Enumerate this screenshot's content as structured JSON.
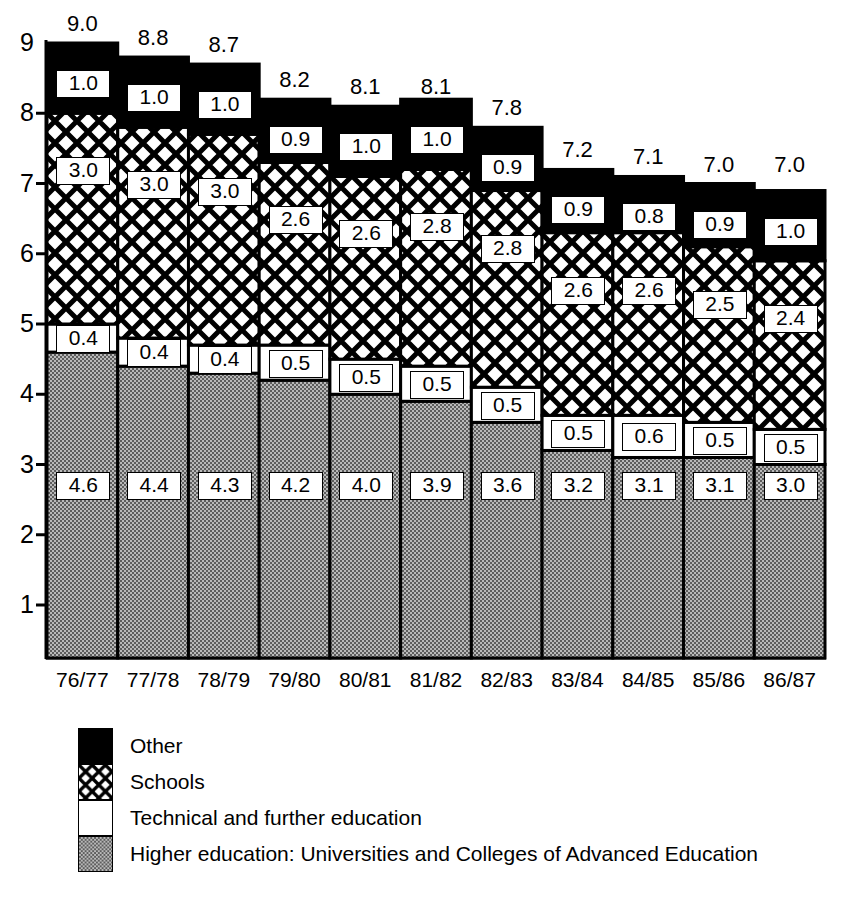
{
  "chart_data": {
    "type": "bar",
    "stacked": true,
    "title": "",
    "subtitle": "",
    "xlabel": "",
    "ylabel": "",
    "categories": [
      "76/77",
      "77/78",
      "78/79",
      "79/80",
      "80/81",
      "81/82",
      "82/83",
      "83/84",
      "84/85",
      "85/86",
      "86/87"
    ],
    "yticks": [
      1,
      2,
      3,
      4,
      5,
      6,
      7,
      8,
      9
    ],
    "ylim": [
      0,
      9.4
    ],
    "grid": false,
    "legend_position": "bottom-left",
    "series": [
      {
        "name": "Higher education: Universities and Colleges of Advanced Education",
        "fill": "grey-stipple",
        "color": "#9a9a9a",
        "values": [
          4.6,
          4.4,
          4.3,
          4.2,
          4.0,
          3.9,
          3.6,
          3.2,
          3.1,
          3.1,
          3.0
        ]
      },
      {
        "name": "Technical and further education",
        "fill": "white",
        "color": "#ffffff",
        "values": [
          0.4,
          0.4,
          0.4,
          0.5,
          0.5,
          0.5,
          0.5,
          0.5,
          0.6,
          0.5,
          0.5
        ]
      },
      {
        "name": "Schools",
        "fill": "crosshatch",
        "color": "#ffffff",
        "values": [
          3.0,
          3.0,
          3.0,
          2.6,
          2.6,
          2.8,
          2.8,
          2.6,
          2.6,
          2.5,
          2.4
        ]
      },
      {
        "name": "Other",
        "fill": "black",
        "color": "#000000",
        "values": [
          1.0,
          1.0,
          1.0,
          0.9,
          1.0,
          1.0,
          0.9,
          0.9,
          0.8,
          0.9,
          1.0
        ]
      }
    ],
    "totals": [
      9.0,
      8.8,
      8.7,
      8.2,
      8.1,
      8.1,
      7.8,
      7.2,
      7.1,
      7.0,
      7.0
    ]
  },
  "legend": {
    "items": [
      {
        "label": "Other",
        "fill": "black"
      },
      {
        "label": "Schools",
        "fill": "crosshatch"
      },
      {
        "label": "Technical and further education",
        "fill": "white"
      },
      {
        "label": "Higher education: Universities and Colleges of Advanced Education",
        "fill": "grey-stipple"
      }
    ]
  },
  "colors": {
    "ink": "#000000",
    "paper": "#ffffff",
    "grey_fill": "#9a9a9a"
  }
}
